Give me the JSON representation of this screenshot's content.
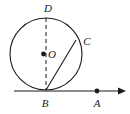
{
  "figure": {
    "kind": "geometry-diagram",
    "width": 130,
    "height": 114,
    "background_color": "#ffffff",
    "stroke_color": "#1a1a1a",
    "labels": {
      "center": "O",
      "top": "D",
      "chord_end": "C",
      "tangent_point": "B",
      "tangent_point_a": "A"
    },
    "points": [
      {
        "name": "D",
        "label": "D",
        "x": 46,
        "y": 18,
        "label_x": 48,
        "label_y": 8,
        "dot": false
      },
      {
        "name": "O",
        "label": "O",
        "x": 46,
        "y": 54,
        "label_x": 55,
        "label_y": 55,
        "dot": true
      },
      {
        "name": "C",
        "label": "C",
        "x": 76,
        "y": 40,
        "label_x": 87,
        "label_y": 42,
        "dot": false
      },
      {
        "name": "B",
        "label": "B",
        "x": 46,
        "y": 90,
        "label_x": 45,
        "label_y": 105,
        "dot": false
      },
      {
        "name": "A",
        "label": "A",
        "x": 97,
        "y": 91,
        "label_x": 97,
        "label_y": 105,
        "dot": true
      }
    ],
    "circle": {
      "cx": 46,
      "cy": 54,
      "r": 36
    },
    "segments": [
      {
        "name": "diameter-DB",
        "style": "dashed",
        "x1": 46,
        "y1": 18,
        "x2": 46,
        "y2": 90
      },
      {
        "name": "chord-BC",
        "style": "solid",
        "x1": 46,
        "y1": 90,
        "x2": 76,
        "y2": 40
      }
    ],
    "ray": {
      "name": "tangent-ray-BA",
      "x1": 14,
      "y1": 91,
      "x2": 126,
      "y2": 91,
      "arrow": true
    }
  }
}
